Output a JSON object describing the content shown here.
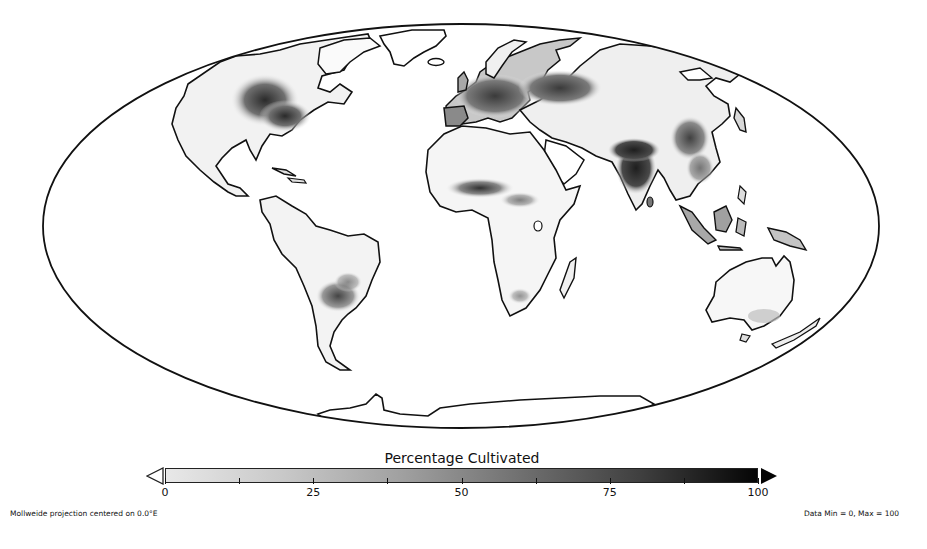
{
  "map": {
    "projection_label": "Mollweide projection centered on 0.0°E",
    "data_range_label": "Data Min = 0, Max = 100",
    "variable": "Percentage Cultivated",
    "outline_color": "#111111",
    "ocean_color": "#ffffff"
  },
  "colorbar": {
    "title": "Percentage Cultivated",
    "min": 0,
    "max": 100,
    "color_low": "#e8e8e8",
    "color_high": "#050505",
    "major_ticks": [
      {
        "value": 0,
        "label": "0"
      },
      {
        "value": 25,
        "label": "25"
      },
      {
        "value": 50,
        "label": "50"
      },
      {
        "value": 75,
        "label": "75"
      },
      {
        "value": 100,
        "label": "100"
      }
    ],
    "minor_ticks": [
      12.5,
      37.5,
      62.5,
      87.5
    ],
    "extend_low": "open-triangle",
    "extend_high": "filled-triangle"
  },
  "chart_data": {
    "type": "heatmap",
    "title": "Percentage Cultivated",
    "projection": "Mollweide, centered on 0.0°E",
    "colorscale": "grayscale (light = 0, black = 100)",
    "value_range": [
      0,
      100
    ],
    "tick_labels": [
      "0",
      "25",
      "50",
      "75",
      "100"
    ],
    "annotations": [
      "Mollweide projection centered on 0.0°E",
      "Data Min = 0, Max = 100"
    ],
    "high_intensity_regions": [
      {
        "region": "US Midwest / Great Plains",
        "approx_level": 70
      },
      {
        "region": "Europe / Ukraine / Western Russia",
        "approx_level": 65
      },
      {
        "region": "India / Bangladesh",
        "approx_level": 80
      },
      {
        "region": "Eastern China",
        "approx_level": 60
      },
      {
        "region": "West African Sahel (Nigeria)",
        "approx_level": 55
      },
      {
        "region": "Argentine Pampas / Southern Brazil",
        "approx_level": 50
      },
      {
        "region": "Southeast Asia / Java",
        "approx_level": 50
      }
    ],
    "low_intensity_regions": [
      {
        "region": "Sahara / Arabia",
        "approx_level": 0
      },
      {
        "region": "Amazon Basin",
        "approx_level": 5
      },
      {
        "region": "Siberia / Canada north",
        "approx_level": 0
      },
      {
        "region": "Australia interior",
        "approx_level": 2
      },
      {
        "region": "Greenland / Antarctica",
        "approx_level": 0
      }
    ]
  }
}
